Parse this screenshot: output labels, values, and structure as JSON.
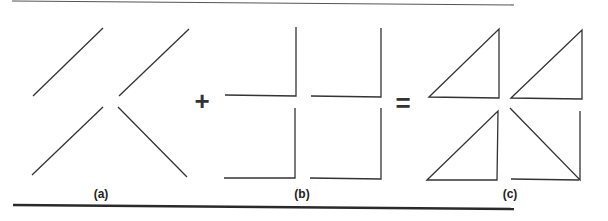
{
  "figure": {
    "operators": {
      "plus": "+",
      "equals": "="
    },
    "panels": [
      {
        "id": "a",
        "label": "(a)",
        "description": "four diagonal line segments"
      },
      {
        "id": "b",
        "label": "(b)",
        "description": "four L-shaped right-angle corners"
      },
      {
        "id": "c",
        "label": "(c)",
        "description": "right triangles formed by combining (a) and (b)"
      }
    ],
    "colors": {
      "stroke": "#333333",
      "rule": "#2a2a2a"
    }
  }
}
